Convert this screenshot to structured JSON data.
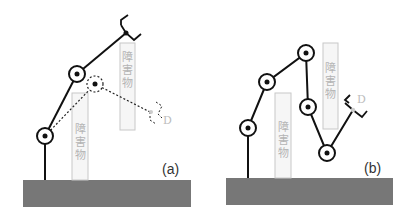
{
  "figure": {
    "colors": {
      "ground": "#777777",
      "obstacle_fill": "#f6f6f6",
      "obstacle_stroke": "#c8c8c8",
      "obstacle_text": "#b4b4b4",
      "arm": "#111111",
      "ghost": "#bbbbbb"
    },
    "panels": [
      {
        "label": "(a)",
        "obstacles": [
          {
            "text": "障害物",
            "chars": [
              "障",
              "害",
              "物"
            ]
          },
          {
            "text": "障害物",
            "chars": [
              "障",
              "害",
              "物"
            ]
          }
        ],
        "target_label": "D"
      },
      {
        "label": "(b)",
        "obstacles": [
          {
            "text": "障害物",
            "chars": [
              "障",
              "害",
              "物"
            ]
          },
          {
            "text": "障害物",
            "chars": [
              "障",
              "害",
              "物"
            ]
          }
        ],
        "target_label": "D"
      }
    ]
  }
}
